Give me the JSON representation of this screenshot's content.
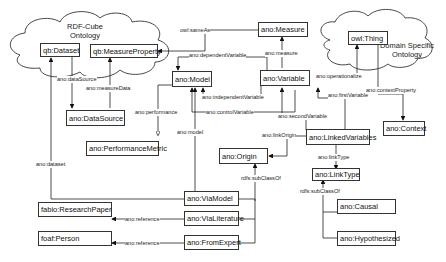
{
  "clouds": {
    "rdf_cube": {
      "title_line1": "RDF-Cube",
      "title_line2": "Ontology"
    },
    "domain": {
      "title_line1": "Domain Specific",
      "title_line2": "Ontology"
    }
  },
  "nodes": {
    "dataset": "qb:Dataset",
    "measure_property": "qb:MeasureProperty",
    "measure": "ano:Measure",
    "owl_thing": "owl:Thing",
    "model": "ano:Model",
    "variable": "ano:Variable",
    "data_source": "ano:DataSource",
    "performance_metric": "ano:PerformanceMetric",
    "context": "ano:Context",
    "linked_variables": "ano:LinkedVariables",
    "origin": "ano:Origin",
    "link_type": "ano:LinkType",
    "via_model": "ano:ViaModel",
    "via_literature": "ano:ViaLiterature",
    "from_expert": "ano:FromExpert",
    "research_paper": "fabio:ResearchPaper",
    "person": "foaf:Person",
    "causal": "ano:Causal",
    "hypothesized": "ano:Hypothesized"
  },
  "edges": {
    "same_as": "owl:sameAs",
    "dependent_variable": "ano:dependentVariable",
    "measure": "ano:measure",
    "data_source": "ano:dataSource",
    "measure_data": "ano:measureData",
    "operationalize": "ano:operationalize",
    "context_property": "ano:contextProperty",
    "performance": "ano:performance",
    "independent_variable": "ano:independentVariable",
    "control_variable": "ano:controlVariable",
    "first_variable": "ano:firstVariable",
    "second_variable": "ano:secondVariable",
    "model": "ano:model",
    "link_origin": "ano:linkOrigin",
    "link_type": "ano:linkType",
    "dataset": "ano:dataset",
    "subclass_origin": "rdfs:subClassOf",
    "subclass_linktype": "rdfs:subClassOf",
    "reference_lit": "ano:reference",
    "reference_expert": "ano:reference"
  }
}
